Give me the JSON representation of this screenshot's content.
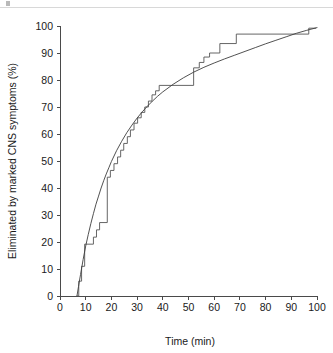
{
  "figure": {
    "background_color": "#ffffff",
    "line_color": "#555555",
    "fit_color": "#3d3d3d",
    "axis_color": "#4a4a4a",
    "page_rule_color": "#d8d8d8"
  },
  "chart_data": {
    "type": "line",
    "title": "",
    "subtitle": "",
    "xlabel": "Time (min)",
    "ylabel": "Eliminated by marked CNS symptoms (%)",
    "xlim": [
      0,
      100
    ],
    "ylim": [
      0,
      100
    ],
    "xticks": [
      0,
      10,
      20,
      30,
      40,
      50,
      60,
      70,
      80,
      90,
      100
    ],
    "xtick_labels": [
      "0",
      "10",
      "20",
      "30",
      "40",
      "50",
      "60",
      "70",
      "80",
      "90",
      "100"
    ],
    "yticks": [
      0,
      10,
      20,
      30,
      40,
      50,
      60,
      70,
      80,
      90,
      100
    ],
    "ytick_labels": [
      "0",
      "10",
      "20",
      "30",
      "40",
      "50",
      "60",
      "70",
      "80",
      "90",
      "100"
    ],
    "grid": false,
    "legend": false,
    "legend_position": "none",
    "annotations": [],
    "series": [
      {
        "name": "Observed cumulative elimination (step function)",
        "type": "step",
        "style": "solid",
        "color": "#555555",
        "points": [
          [
            6.4,
            0
          ],
          [
            7.3,
            0
          ],
          [
            7.3,
            5.5
          ],
          [
            8.4,
            5.5
          ],
          [
            8.4,
            11.0
          ],
          [
            9.6,
            11.0
          ],
          [
            9.6,
            19.2
          ],
          [
            13.0,
            19.2
          ],
          [
            13.0,
            21.8
          ],
          [
            14.2,
            21.8
          ],
          [
            14.2,
            24.5
          ],
          [
            15.4,
            24.5
          ],
          [
            15.4,
            27.2
          ],
          [
            18.4,
            27.2
          ],
          [
            18.4,
            44.0
          ],
          [
            19.6,
            44.0
          ],
          [
            19.6,
            46.5
          ],
          [
            21.0,
            46.5
          ],
          [
            21.0,
            49.0
          ],
          [
            22.4,
            49.0
          ],
          [
            22.4,
            51.5
          ],
          [
            23.6,
            51.5
          ],
          [
            23.6,
            54.0
          ],
          [
            24.8,
            54.0
          ],
          [
            24.8,
            56.5
          ],
          [
            26.2,
            56.5
          ],
          [
            26.2,
            59.0
          ],
          [
            27.4,
            59.0
          ],
          [
            27.4,
            61.5
          ],
          [
            28.8,
            61.5
          ],
          [
            28.8,
            64.0
          ],
          [
            30.2,
            64.0
          ],
          [
            30.2,
            66.0
          ],
          [
            31.6,
            66.0
          ],
          [
            31.6,
            68.0
          ],
          [
            33.0,
            68.0
          ],
          [
            33.0,
            70.0
          ],
          [
            34.4,
            70.0
          ],
          [
            34.4,
            72.2
          ],
          [
            35.8,
            72.2
          ],
          [
            35.8,
            74.5
          ],
          [
            37.2,
            74.5
          ],
          [
            37.2,
            76.0
          ],
          [
            38.6,
            76.0
          ],
          [
            38.6,
            78.0
          ],
          [
            52.0,
            78.0
          ],
          [
            52.0,
            84.5
          ],
          [
            54.2,
            84.5
          ],
          [
            54.2,
            86.5
          ],
          [
            56.0,
            86.5
          ],
          [
            56.0,
            88.5
          ],
          [
            58.2,
            88.5
          ],
          [
            58.2,
            90.0
          ],
          [
            62.2,
            90.0
          ],
          [
            62.2,
            93.5
          ],
          [
            68.6,
            93.5
          ],
          [
            68.6,
            97.0
          ],
          [
            96.8,
            97.0
          ],
          [
            96.8,
            99.2
          ],
          [
            99.6,
            99.2
          ]
        ]
      },
      {
        "name": "Fitted exponential model",
        "type": "curve",
        "style": "solid",
        "color": "#3d3d3d",
        "points": [
          [
            6.6,
            0
          ],
          [
            7.2,
            3.5
          ],
          [
            8.0,
            8.0
          ],
          [
            9.0,
            13.5
          ],
          [
            10.0,
            18.5
          ],
          [
            11.0,
            22.8
          ],
          [
            12.0,
            26.8
          ],
          [
            13.0,
            30.5
          ],
          [
            14.0,
            34.0
          ],
          [
            15.0,
            37.0
          ],
          [
            16.0,
            40.0
          ],
          [
            17.0,
            42.7
          ],
          [
            18.0,
            45.2
          ],
          [
            19.0,
            47.5
          ],
          [
            20.0,
            49.8
          ],
          [
            22.0,
            53.8
          ],
          [
            24.0,
            57.3
          ],
          [
            26.0,
            60.5
          ],
          [
            28.0,
            63.3
          ],
          [
            30.0,
            65.9
          ],
          [
            32.0,
            68.2
          ],
          [
            34.0,
            70.3
          ],
          [
            36.0,
            72.2
          ],
          [
            38.0,
            74.0
          ],
          [
            40.0,
            75.6
          ],
          [
            44.0,
            78.4
          ],
          [
            48.0,
            80.8
          ],
          [
            52.0,
            82.9
          ],
          [
            56.0,
            84.7
          ],
          [
            60.0,
            86.3
          ],
          [
            64.0,
            87.8
          ],
          [
            68.0,
            89.2
          ],
          [
            72.0,
            90.6
          ],
          [
            76.0,
            92.0
          ],
          [
            80.0,
            93.4
          ],
          [
            84.0,
            94.7
          ],
          [
            88.0,
            96.0
          ],
          [
            92.0,
            97.3
          ],
          [
            96.0,
            98.4
          ],
          [
            100.0,
            99.4
          ]
        ]
      }
    ]
  }
}
